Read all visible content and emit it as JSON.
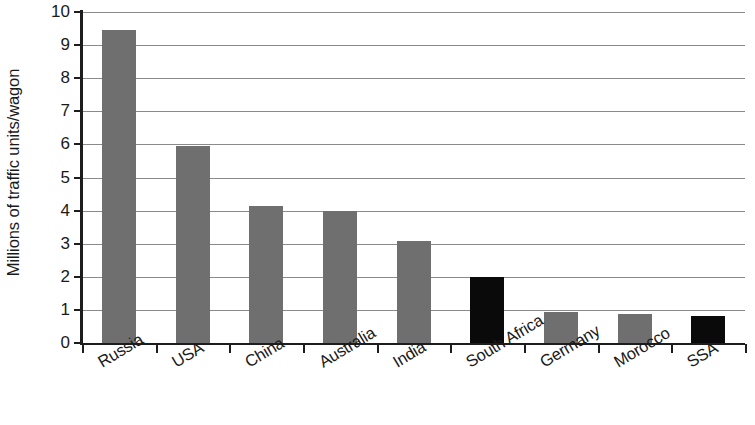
{
  "chart_data": {
    "type": "bar",
    "title": "",
    "xlabel": "",
    "ylabel": "Millions of traffic units/wagon",
    "ylim": [
      0,
      10
    ],
    "ytick_labels": [
      "10",
      "9",
      "8",
      "7",
      "6",
      "5",
      "4",
      "3",
      "2",
      "1",
      "0"
    ],
    "yticks": [
      10,
      9,
      8,
      7,
      6,
      5,
      4,
      3,
      2,
      1,
      0
    ],
    "grid": true,
    "legend": "none",
    "categories": [
      "Russia",
      "USA",
      "China",
      "Australia",
      "India",
      "South Africa",
      "Germany",
      "Morocco",
      "SSA"
    ],
    "values": [
      9.45,
      5.95,
      4.15,
      4.0,
      3.08,
      2.0,
      0.95,
      0.87,
      0.82
    ],
    "bar_colors": [
      "#6f6f6f",
      "#6f6f6f",
      "#6f6f6f",
      "#6f6f6f",
      "#6f6f6f",
      "#0a0a0a",
      "#6f6f6f",
      "#6f6f6f",
      "#0a0a0a"
    ],
    "highlight_color": "#0a0a0a",
    "series_color": "#6f6f6f",
    "axis_color": "#1d1d1d",
    "gridline_color": "#8a8a8a"
  }
}
